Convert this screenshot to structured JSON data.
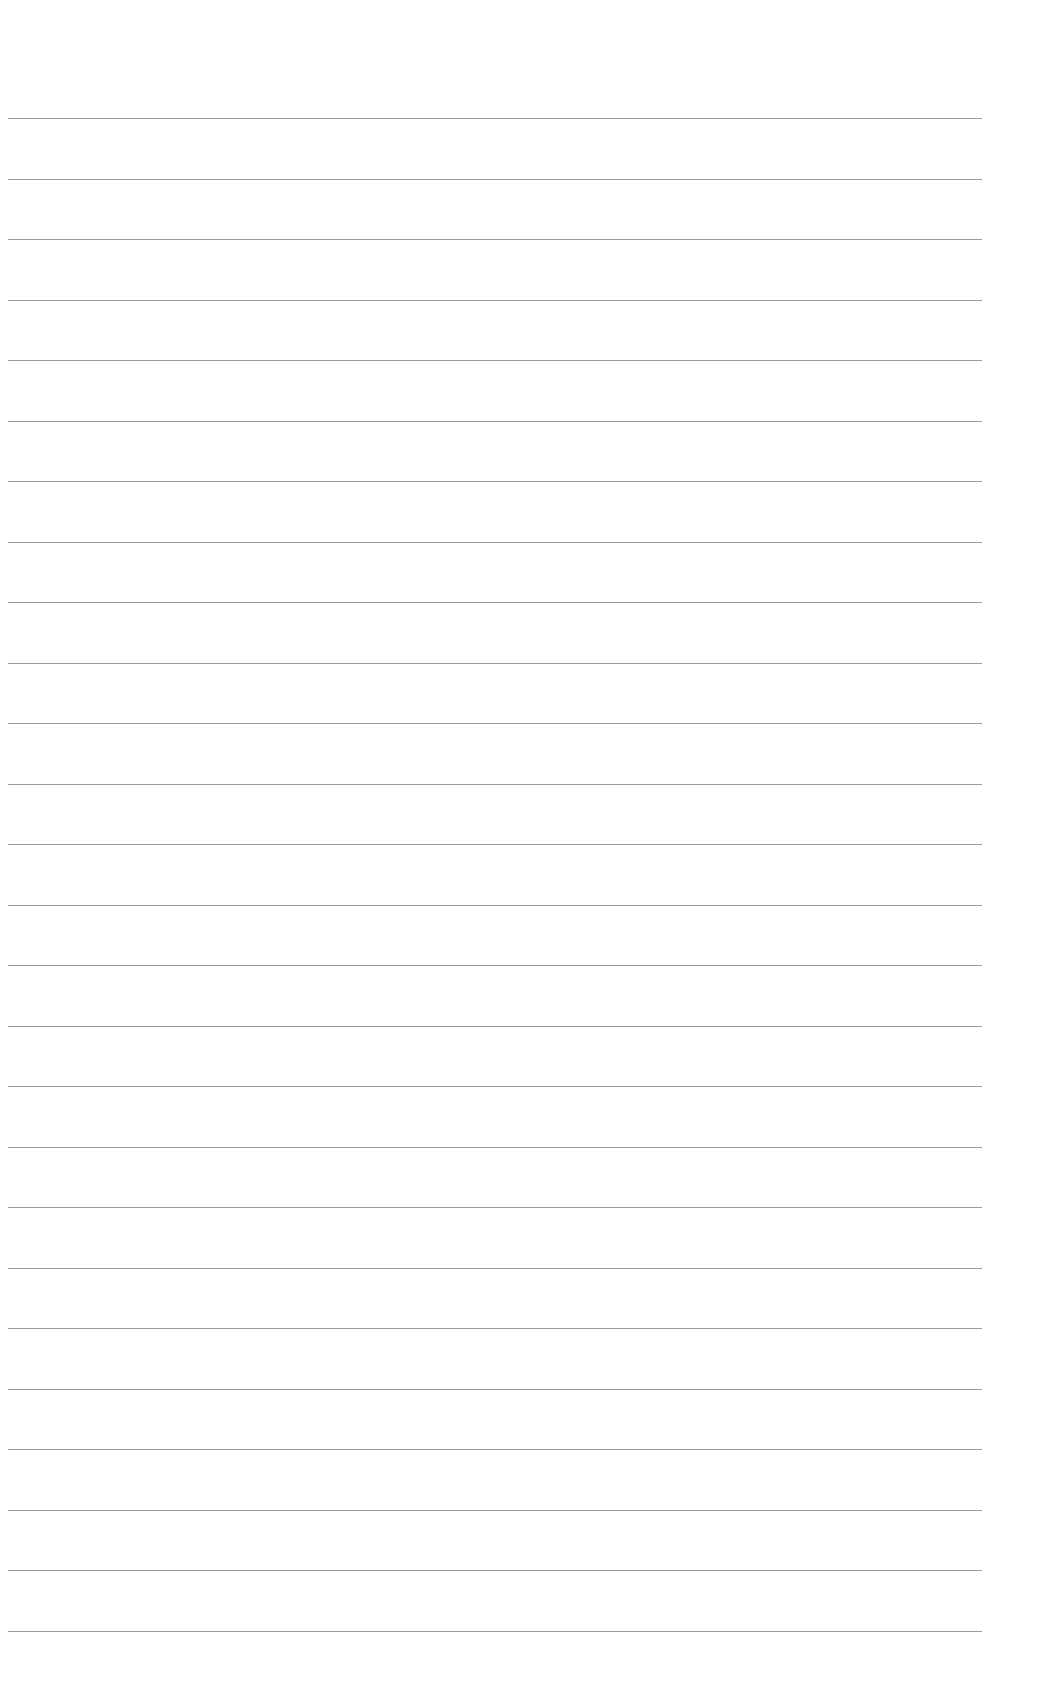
{
  "document": {
    "type": "lined-paper",
    "line_count": 26,
    "first_line_y": 118,
    "line_spacing": 60.5,
    "line_left": 8,
    "line_right": 982,
    "line_color": "#8a8a8a",
    "background_color": "#ffffff",
    "text_content": []
  }
}
